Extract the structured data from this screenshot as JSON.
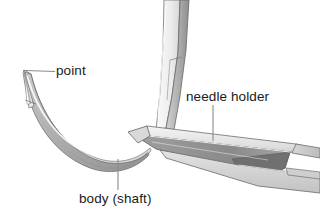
{
  "figure": {
    "background_color": "#ffffff",
    "width": 320,
    "height": 219
  },
  "labels": {
    "point": "point",
    "needle_holder": "needle holder",
    "body_shaft": "body (shaft)"
  },
  "leaders": {
    "point": {
      "from_x": 55,
      "from_y": 71.5,
      "to_x": 25,
      "to_y": 70.5
    },
    "needle_holder": {
      "from_x": 213,
      "from_y": 104,
      "to_x": 213,
      "to_y": 140
    },
    "body_shaft": {
      "from_x": 118,
      "from_y": 190,
      "to_x": 118,
      "to_y": 160
    }
  },
  "parts": {
    "needle_point": "needle-point",
    "needle_body": "needle-body-shaft",
    "holder_upper_jaw": "needle-holder-upper-jaw",
    "holder_lower_jaw": "needle-holder-lower-jaw",
    "holder_lower_plate": "needle-holder-lower-plate"
  },
  "colors": {
    "outline": "#585858",
    "leader_line": "#8a8a8a",
    "text": "#1a1a1a",
    "metal_light": "#f2f2f2",
    "metal_mid": "#c9c9c9",
    "metal_dark": "#9a9a9a",
    "metal_shadow": "#6f6f6f",
    "highlight": "#ffffff"
  }
}
